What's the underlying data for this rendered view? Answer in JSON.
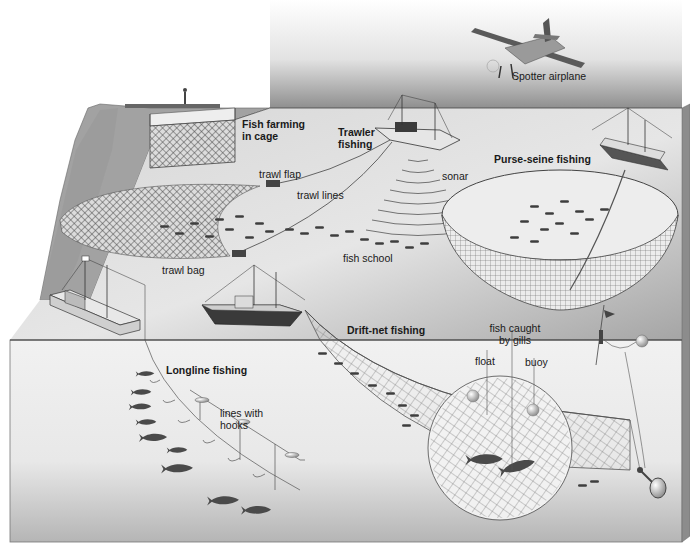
{
  "diagram": {
    "labels": {
      "spotter_airplane": "Spotter airplane",
      "fish_farming": "Fish farming in cage",
      "trawler_fishing": "Trawler fishing",
      "trawl_flap": "trawl flap",
      "trawl_lines": "trawl lines",
      "sonar": "sonar",
      "trawl_bag": "trawl bag",
      "fish_school": "fish school",
      "purse_seine": "Purse-seine fishing",
      "drift_net": "Drift-net fishing",
      "fish_caught_by_gills": "fish caught by gills",
      "float": "float",
      "buoy": "buoy",
      "longline": "Longline fishing",
      "lines_with_hooks": "lines with hooks"
    },
    "colors": {
      "sky_top": "#ffffff",
      "sky_bottom": "#9a9a9a",
      "sea_surface": "#c9c9c9",
      "sea_surface_dark": "#9c9c9c",
      "underwater": "#eeeeee",
      "underwater_bottom": "#b8b8b8",
      "fish": "#4a4a4a",
      "line": "#333333",
      "cliff": "#a8a8a8"
    }
  }
}
